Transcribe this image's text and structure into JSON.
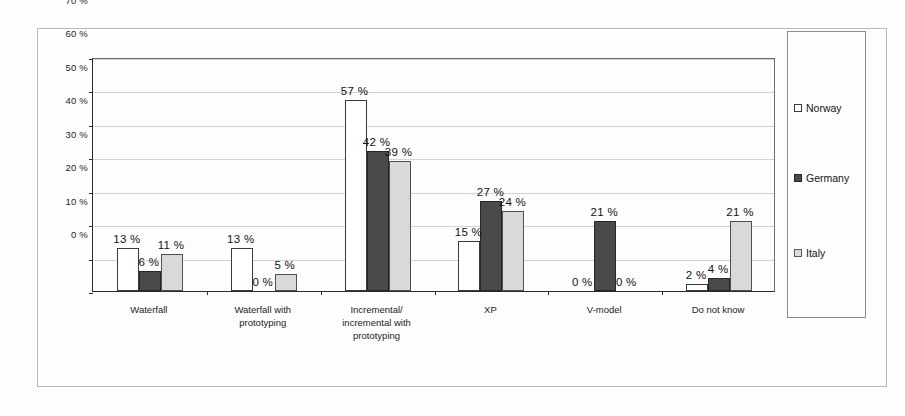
{
  "chart_data": {
    "type": "bar",
    "title": "",
    "subtitle": "",
    "xlabel": "",
    "ylabel": "",
    "ylim": [
      0,
      70
    ],
    "ytick_labels": [
      "0 %",
      "10 %",
      "20 %",
      "30 %",
      "40 %",
      "50 %",
      "60 %",
      "70 %"
    ],
    "ytick_values": [
      0,
      10,
      20,
      30,
      40,
      50,
      60,
      70
    ],
    "grid": true,
    "legend_position": "right",
    "value_suffix": " %",
    "categories": [
      "Waterfall",
      "Waterfall with\nprototyping",
      "Incremental/\nincremental with\nprototyping",
      "XP",
      "V-model",
      "Do not know"
    ],
    "series": [
      {
        "name": "Norway",
        "color": "#ffffff",
        "values": [
          13,
          13,
          57,
          15,
          0,
          2
        ],
        "labels": [
          "13 %",
          "13 %",
          "57 %",
          "15 %",
          "0 %",
          "2 %"
        ]
      },
      {
        "name": "Germany",
        "color": "#4a4a4a",
        "values": [
          6,
          0,
          42,
          27,
          21,
          4
        ],
        "labels": [
          "6 %",
          "0 %",
          "42 %",
          "27 %",
          "21 %",
          "4 %"
        ]
      },
      {
        "name": "Italy",
        "color": "#d9d9d9",
        "values": [
          11,
          5,
          39,
          24,
          0,
          21
        ],
        "labels": [
          "11 %",
          "5 %",
          "39 %",
          "24 %",
          "0 %",
          "21 %"
        ]
      }
    ]
  },
  "legend": {
    "items": [
      {
        "label": "Norway",
        "swatch": "norway"
      },
      {
        "label": "Germany",
        "swatch": "germany"
      },
      {
        "label": "Italy",
        "swatch": "italy"
      }
    ]
  }
}
